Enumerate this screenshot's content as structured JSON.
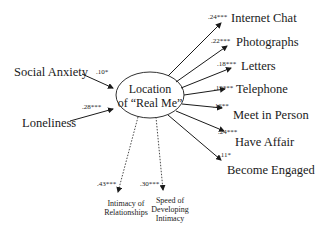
{
  "diagram": {
    "center_node": {
      "line1": "Location",
      "line2": "of “Real Me”"
    },
    "predictors": [
      {
        "label": "Social Anxiety",
        "coef": ".10*"
      },
      {
        "label": "Loneliness",
        "coef": ".28***"
      }
    ],
    "outcomes_right": [
      {
        "label": "Internet Chat",
        "coef": ".24***"
      },
      {
        "label": "Photographs",
        "coef": ".22***"
      },
      {
        "label": "Letters",
        "coef": ".18***"
      },
      {
        "label": "Telephone",
        "coef": ".19***"
      },
      {
        "label": "Meet in Person",
        "coef": ".16**"
      },
      {
        "label": "Have Affair",
        "coef": ".24***"
      },
      {
        "label": "Become Engaged",
        "coef": ".11*"
      }
    ],
    "outcomes_bottom": [
      {
        "line1": "Intimacy of",
        "line2": "Relationships",
        "coef": ".43***"
      },
      {
        "line1": "Speed of",
        "line2": "Developing",
        "line3": "Intimacy",
        "coef": ".30***"
      }
    ]
  }
}
